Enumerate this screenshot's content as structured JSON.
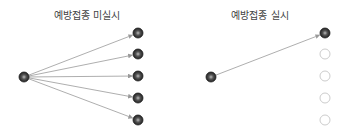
{
  "left_panel": {
    "title": "예방접종 미실시",
    "source": {
      "x": 24,
      "y": 77,
      "state": "filled"
    },
    "targets": [
      {
        "x": 138,
        "y": 33,
        "state": "filled",
        "connected": true
      },
      {
        "x": 138,
        "y": 54,
        "state": "filled",
        "connected": true
      },
      {
        "x": 138,
        "y": 76,
        "state": "filled",
        "connected": true
      },
      {
        "x": 138,
        "y": 98,
        "state": "filled",
        "connected": true
      },
      {
        "x": 138,
        "y": 120,
        "state": "filled",
        "connected": true
      }
    ]
  },
  "right_panel": {
    "title": "예방접종 실시",
    "source": {
      "x": 211,
      "y": 77,
      "state": "filled"
    },
    "targets": [
      {
        "x": 325,
        "y": 33,
        "state": "filled",
        "connected": true
      },
      {
        "x": 325,
        "y": 54,
        "state": "empty",
        "connected": false
      },
      {
        "x": 325,
        "y": 76,
        "state": "empty",
        "connected": false
      },
      {
        "x": 325,
        "y": 98,
        "state": "empty",
        "connected": false
      },
      {
        "x": 325,
        "y": 120,
        "state": "empty",
        "connected": false
      }
    ]
  },
  "colors": {
    "node_fill": "#333333",
    "node_highlight": "#888888",
    "edge": "#999999",
    "empty_node": "#cccccc"
  }
}
